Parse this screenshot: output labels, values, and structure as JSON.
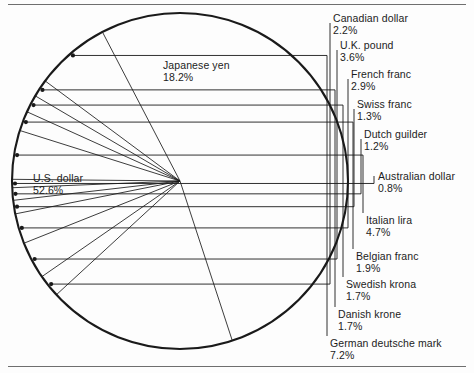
{
  "figure": {
    "name": "currency-composition-pie-chart",
    "rule_color": "#6f6f6f",
    "line_color": "#1a1a1a",
    "background": "#fdfdfd"
  },
  "chart_data": {
    "type": "pie",
    "title": "",
    "subtitle": "",
    "xlabel": "",
    "ylabel": "",
    "units": "percent",
    "legend_position": "callout-labels",
    "grid": false,
    "total": 100.0,
    "categories": [
      "U.S. dollar",
      "Japanese yen",
      "Canadian dollar",
      "U.K. pound",
      "French franc",
      "Swiss franc",
      "Dutch guilder",
      "Australian dollar",
      "Italian lira",
      "Belgian franc",
      "Swedish krona",
      "Danish krone",
      "German deutsche mark"
    ],
    "values": [
      52.6,
      18.2,
      2.2,
      3.6,
      2.9,
      1.3,
      1.2,
      0.8,
      4.7,
      1.9,
      1.7,
      1.7,
      7.2
    ],
    "slices": [
      {
        "label": "U.S. dollar",
        "value": 52.6,
        "value_text": "52.6%",
        "label_placement": "inside-left"
      },
      {
        "label": "Japanese yen",
        "value": 18.2,
        "value_text": "18.2%",
        "label_placement": "inside-top"
      },
      {
        "label": "Canadian dollar",
        "value": 2.2,
        "value_text": "2.2%",
        "label_placement": "callout-right"
      },
      {
        "label": "U.K. pound",
        "value": 3.6,
        "value_text": "3.6%",
        "label_placement": "callout-right"
      },
      {
        "label": "French franc",
        "value": 2.9,
        "value_text": "2.9%",
        "label_placement": "callout-right"
      },
      {
        "label": "Swiss franc",
        "value": 1.3,
        "value_text": "1.3%",
        "label_placement": "callout-right"
      },
      {
        "label": "Dutch guilder",
        "value": 1.2,
        "value_text": "1.2%",
        "label_placement": "callout-right"
      },
      {
        "label": "Australian dollar",
        "value": 0.8,
        "value_text": "0.8%",
        "label_placement": "callout-right"
      },
      {
        "label": "Italian lira",
        "value": 4.7,
        "value_text": "4.7%",
        "label_placement": "callout-right"
      },
      {
        "label": "Belgian franc",
        "value": 1.9,
        "value_text": "1.9%",
        "label_placement": "callout-right"
      },
      {
        "label": "Swedish krona",
        "value": 1.7,
        "value_text": "1.7%",
        "label_placement": "callout-right"
      },
      {
        "label": "Danish krone",
        "value": 1.7,
        "value_text": "1.7%",
        "label_placement": "callout-right"
      },
      {
        "label": "German deutsche mark",
        "value": 7.2,
        "value_text": "7.2%",
        "label_placement": "callout-right"
      }
    ]
  },
  "labels": {
    "us_dollar": {
      "name": "U.S. dollar",
      "pct": "52.6%"
    },
    "japanese_yen": {
      "name": "Japanese yen",
      "pct": "18.2%"
    },
    "canadian_dollar": {
      "name": "Canadian dollar",
      "pct": "2.2%"
    },
    "uk_pound": {
      "name": "U.K. pound",
      "pct": "3.6%"
    },
    "french_franc": {
      "name": "French franc",
      "pct": "2.9%"
    },
    "swiss_franc": {
      "name": "Swiss franc",
      "pct": "1.3%"
    },
    "dutch_guilder": {
      "name": "Dutch guilder",
      "pct": "1.2%"
    },
    "australian_dollar": {
      "name": "Australian dollar",
      "pct": "0.8%"
    },
    "italian_lira": {
      "name": "Italian lira",
      "pct": "4.7%"
    },
    "belgian_franc": {
      "name": "Belgian franc",
      "pct": "1.9%"
    },
    "swedish_krona": {
      "name": "Swedish krona",
      "pct": "1.7%"
    },
    "danish_krone": {
      "name": "Danish krone",
      "pct": "1.7%"
    },
    "german_mark": {
      "name": "German deutsche mark",
      "pct": "7.2%"
    }
  }
}
